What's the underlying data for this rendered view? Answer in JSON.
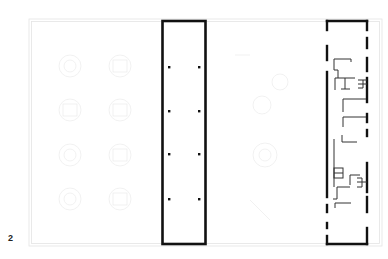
{
  "figure": {
    "number": "2",
    "type": "architectural floor plan"
  },
  "colors": {
    "background": "#ffffff",
    "wall": "#111111",
    "partition": "#333333",
    "ghost_lines": "#e6e6e6",
    "ghost_furniture": "#f0f0f0"
  },
  "plan": {
    "outer_boundary": {
      "x": 30,
      "y": 20,
      "w": 350,
      "h": 225,
      "style": "faint double line"
    },
    "central_volume": {
      "x": 162,
      "y": 20,
      "w": 44,
      "h": 225,
      "style": "solid thick outline",
      "columns": [
        [
          169,
          67
        ],
        [
          199,
          67
        ],
        [
          169,
          111
        ],
        [
          199,
          111
        ],
        [
          169,
          154
        ],
        [
          199,
          154
        ],
        [
          169,
          199
        ],
        [
          199,
          199
        ]
      ]
    },
    "right_volume": {
      "x": 327,
      "y": 20,
      "w": 40,
      "h": 225,
      "style": "dashed thick outline with interior partitions"
    },
    "ghost_furniture_groups": [
      {
        "cx": 70,
        "cy": 66
      },
      {
        "cx": 120,
        "cy": 66
      },
      {
        "cx": 70,
        "cy": 110
      },
      {
        "cx": 120,
        "cy": 110
      },
      {
        "cx": 70,
        "cy": 155
      },
      {
        "cx": 120,
        "cy": 155
      },
      {
        "cx": 70,
        "cy": 199
      },
      {
        "cx": 120,
        "cy": 199
      },
      {
        "cx": 265,
        "cy": 155
      },
      {
        "cx": 280,
        "cy": 85
      }
    ]
  }
}
